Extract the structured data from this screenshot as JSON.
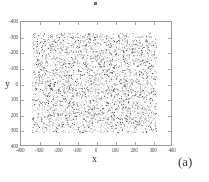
{
  "figure": {
    "panel_label": "(a)",
    "artifact_marker": "stray-dot"
  },
  "chart_data": {
    "type": "scatter",
    "title": "",
    "subtitle": "",
    "xlabel": "x",
    "ylabel": "y",
    "xlim": [
      -400,
      400
    ],
    "ylim": [
      -400,
      400
    ],
    "y_axis_inverted": true,
    "grid": false,
    "legend": null,
    "marker_color": "#555555",
    "marker_size_px": 1,
    "point_count_estimate": 5000,
    "data_extent": {
      "x_min": -340,
      "x_max": 320,
      "y_min": -330,
      "y_max": 320
    },
    "distribution": "uniform-random",
    "xticks": [
      -400,
      -300,
      -200,
      -100,
      0,
      100,
      200,
      300,
      400
    ],
    "xtick_labels": [
      "-400",
      "-300",
      "-200",
      "-100",
      "0",
      "100",
      "200",
      "300",
      "400"
    ],
    "yticks": [
      -400,
      -300,
      -200,
      -100,
      0,
      100,
      200,
      300,
      400
    ],
    "ytick_labels": [
      "-400",
      "-300",
      "-200",
      "-100",
      "0",
      "100",
      "200",
      "300",
      "400"
    ],
    "annotations": [
      "(a)"
    ]
  },
  "axes": {
    "x_title": "x",
    "y_title": "y",
    "frame_color": "#9a9a9a",
    "tick_color": "#a8a8a8",
    "label_color": "#4a4a4a"
  }
}
